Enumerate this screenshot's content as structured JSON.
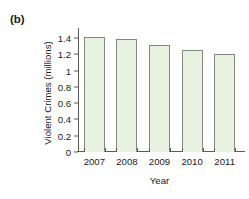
{
  "panel": {
    "label": "(b)"
  },
  "chart_data": {
    "type": "bar",
    "title": "",
    "xlabel": "Year",
    "ylabel": "Violent Crimes (millions)",
    "categories": [
      "2007",
      "2008",
      "2009",
      "2010",
      "2011"
    ],
    "values": [
      1.42,
      1.39,
      1.32,
      1.25,
      1.2
    ],
    "ylim": [
      0,
      1.5
    ],
    "yticks": [
      0,
      0.2,
      0.4,
      0.6,
      0.8,
      1,
      1.2,
      1.4
    ],
    "ytick_labels": [
      "0",
      "0.2",
      "0.4",
      "0.6",
      "0.8",
      "1",
      "1.2",
      "1.4"
    ],
    "grid": false,
    "legend": "none",
    "bar_fill_color": "#e9f1e1",
    "bar_border_color": "#7e8d77",
    "axis_color": "#5a5a5a",
    "text_color": "#1b1b1b"
  }
}
